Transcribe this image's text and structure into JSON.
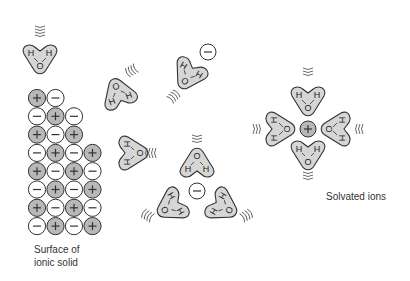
{
  "labels": {
    "surface_line1": "Surface of",
    "surface_line2": "ionic solid",
    "solvated": "Solvated ions"
  },
  "atoms": {
    "hydrogen": "H",
    "oxygen": "O"
  },
  "ions": {
    "cation": "+",
    "anion": "−"
  },
  "colors": {
    "cation_fill": "#b8b8b8",
    "anion_fill": "#ffffff",
    "water_fill": "#d6d6d6",
    "stroke": "#333333"
  },
  "ionic_solid": {
    "rows": [
      [
        "+",
        "−"
      ],
      [
        "−",
        "+",
        "−"
      ],
      [
        "+",
        "−",
        "+"
      ],
      [
        "−",
        "+",
        "−",
        "+"
      ],
      [
        "+",
        "−",
        "+",
        "−"
      ],
      [
        "−",
        "+",
        "−",
        "+"
      ],
      [
        "+",
        "−",
        "+",
        "−"
      ],
      [
        "−",
        "+",
        "−",
        "+"
      ]
    ]
  }
}
